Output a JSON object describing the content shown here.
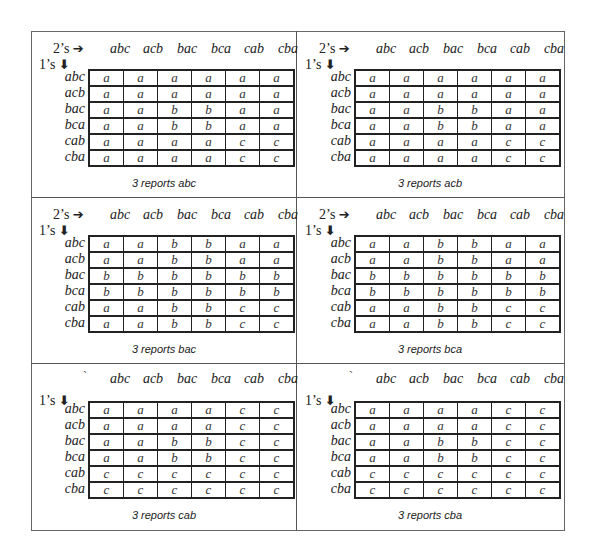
{
  "columns": [
    "abc",
    "acb",
    "bac",
    "bca",
    "cab",
    "cba"
  ],
  "rows": [
    "abc",
    "acb",
    "bac",
    "bca",
    "cab",
    "cba"
  ],
  "labels": {
    "twos": "2’s",
    "ones": "1’s",
    "right_arrow": "➔",
    "down_arrow": "🡫",
    "tick": "`"
  },
  "panels": [
    {
      "caption": "3 reports abc",
      "cells": [
        [
          "a",
          "a",
          "a",
          "a",
          "a",
          "a"
        ],
        [
          "a",
          "a",
          "a",
          "a",
          "a",
          "a"
        ],
        [
          "a",
          "a",
          "b",
          "b",
          "a",
          "a"
        ],
        [
          "a",
          "a",
          "b",
          "b",
          "a",
          "a"
        ],
        [
          "a",
          "a",
          "a",
          "a",
          "c",
          "c"
        ],
        [
          "a",
          "a",
          "a",
          "a",
          "c",
          "c"
        ]
      ]
    },
    {
      "caption": "3 reports acb",
      "cells": [
        [
          "a",
          "a",
          "a",
          "a",
          "a",
          "a"
        ],
        [
          "a",
          "a",
          "a",
          "a",
          "a",
          "a"
        ],
        [
          "a",
          "a",
          "b",
          "b",
          "a",
          "a"
        ],
        [
          "a",
          "a",
          "b",
          "b",
          "a",
          "a"
        ],
        [
          "a",
          "a",
          "a",
          "a",
          "c",
          "c"
        ],
        [
          "a",
          "a",
          "a",
          "a",
          "c",
          "c"
        ]
      ]
    },
    {
      "caption": "3 reports bac",
      "cells": [
        [
          "a",
          "a",
          "b",
          "b",
          "a",
          "a"
        ],
        [
          "a",
          "a",
          "b",
          "b",
          "a",
          "a"
        ],
        [
          "b",
          "b",
          "b",
          "b",
          "b",
          "b"
        ],
        [
          "b",
          "b",
          "b",
          "b",
          "b",
          "b"
        ],
        [
          "a",
          "a",
          "b",
          "b",
          "c",
          "c"
        ],
        [
          "a",
          "a",
          "b",
          "b",
          "c",
          "c"
        ]
      ]
    },
    {
      "caption": "3 reports bca",
      "cells": [
        [
          "a",
          "a",
          "b",
          "b",
          "a",
          "a"
        ],
        [
          "a",
          "a",
          "b",
          "b",
          "a",
          "a"
        ],
        [
          "b",
          "b",
          "b",
          "b",
          "b",
          "b"
        ],
        [
          "b",
          "b",
          "b",
          "b",
          "b",
          "b"
        ],
        [
          "a",
          "a",
          "b",
          "b",
          "c",
          "c"
        ],
        [
          "a",
          "a",
          "b",
          "b",
          "c",
          "c"
        ]
      ]
    },
    {
      "caption": "3 reports cab",
      "cells": [
        [
          "a",
          "a",
          "a",
          "a",
          "c",
          "c"
        ],
        [
          "a",
          "a",
          "a",
          "a",
          "c",
          "c"
        ],
        [
          "a",
          "a",
          "b",
          "b",
          "c",
          "c"
        ],
        [
          "a",
          "a",
          "b",
          "b",
          "c",
          "c"
        ],
        [
          "c",
          "c",
          "c",
          "c",
          "c",
          "c"
        ],
        [
          "c",
          "c",
          "c",
          "c",
          "c",
          "c"
        ]
      ]
    },
    {
      "caption": "3 reports cba",
      "cells": [
        [
          "a",
          "a",
          "a",
          "a",
          "c",
          "c"
        ],
        [
          "a",
          "a",
          "a",
          "a",
          "c",
          "c"
        ],
        [
          "a",
          "a",
          "b",
          "b",
          "c",
          "c"
        ],
        [
          "a",
          "a",
          "b",
          "b",
          "c",
          "c"
        ],
        [
          "c",
          "c",
          "c",
          "c",
          "c",
          "c"
        ],
        [
          "c",
          "c",
          "c",
          "c",
          "c",
          "c"
        ]
      ]
    }
  ]
}
